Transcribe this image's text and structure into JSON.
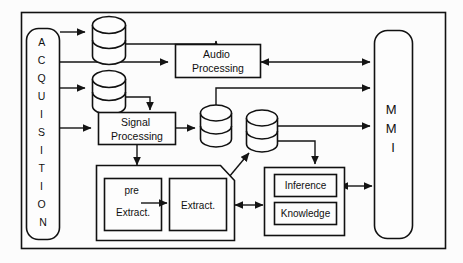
{
  "diagram": {
    "background_color": "#fcfcfc",
    "line_color": "#141414",
    "box_fill_color": "#fdfdfd",
    "nodes": {
      "acquisition": {
        "label": "ACQUISITION",
        "letters": [
          "A",
          "C",
          "Q",
          "U",
          "I",
          "S",
          "I",
          "T",
          "I",
          "O",
          "N"
        ],
        "shape": "rounded-rectangle-vertical"
      },
      "mmi": {
        "label": "MMI",
        "letters": [
          "M",
          "M",
          "I"
        ],
        "shape": "rounded-rectangle-vertical"
      },
      "audio_processing": {
        "line1": "Audio",
        "line2": "Processing",
        "shape": "rectangle"
      },
      "signal_processing": {
        "line1": "Signal",
        "line2": "Processing",
        "shape": "rectangle"
      },
      "pre_extract": {
        "line1": "pre",
        "line2": "Extract.",
        "shape": "rectangle"
      },
      "extract": {
        "line1": "Extract.",
        "shape": "rectangle"
      },
      "inference": {
        "label": "Inference",
        "shape": "rectangle"
      },
      "knowledge": {
        "label": "Knowledge",
        "shape": "rectangle"
      },
      "extraction_group": {
        "label": "",
        "shape": "rectangle-clipped-corner"
      },
      "reasoning_group": {
        "label": "",
        "shape": "rectangle"
      },
      "db_audio_raw": {
        "label": "",
        "shape": "cylinder"
      },
      "db_signal_raw": {
        "label": "",
        "shape": "cylinder"
      },
      "db_processed": {
        "label": "",
        "shape": "cylinder"
      },
      "db_features": {
        "label": "",
        "shape": "cylinder"
      }
    },
    "edges": [
      {
        "from": "acquisition",
        "to": "db_audio_raw",
        "type": "arrow"
      },
      {
        "from": "acquisition",
        "to": "audio_processing",
        "type": "arrow"
      },
      {
        "from": "acquisition",
        "to": "db_signal_raw",
        "type": "arrow"
      },
      {
        "from": "acquisition",
        "to": "signal_processing",
        "type": "arrow"
      },
      {
        "from": "db_audio_raw",
        "to": "audio_processing",
        "type": "arrow"
      },
      {
        "from": "db_signal_raw",
        "to": "signal_processing",
        "type": "arrow"
      },
      {
        "from": "audio_processing",
        "to": "mmi",
        "type": "bidirectional-arrow"
      },
      {
        "from": "signal_processing",
        "to": "db_processed",
        "type": "arrow"
      },
      {
        "from": "signal_processing",
        "to": "extraction_group",
        "type": "arrow"
      },
      {
        "from": "db_processed",
        "to": "mmi",
        "type": "arrow"
      },
      {
        "from": "db_features",
        "to": "mmi",
        "type": "arrow"
      },
      {
        "from": "db_features",
        "to": "reasoning_group",
        "type": "arrow"
      },
      {
        "from": "extraction_group",
        "to": "db_features",
        "type": "arrow-diagonal"
      },
      {
        "from": "extraction_group",
        "to": "reasoning_group",
        "type": "bidirectional-arrow"
      },
      {
        "from": "pre_extract",
        "to": "extract",
        "type": "arrow"
      },
      {
        "from": "reasoning_group",
        "to": "mmi",
        "type": "bidirectional-arrow"
      }
    ]
  }
}
